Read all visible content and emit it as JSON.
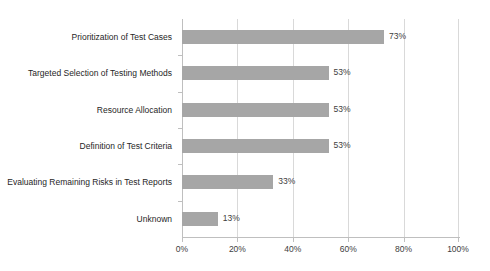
{
  "chart_data": {
    "type": "bar",
    "orientation": "horizontal",
    "title": "",
    "subtitle": "",
    "xlabel": "",
    "ylabel": "",
    "xlim": [
      0,
      100
    ],
    "grid": true,
    "legend": false,
    "legend_position": "none",
    "value_suffix": "%",
    "bar_color": "#A6A6A6",
    "gridline_color": "#D9D9D9",
    "axis_color": "#BFBFBF",
    "label_color": "#262626",
    "value_label_color": "#404040",
    "background_color": "#FFFFFF",
    "categories": [
      "Prioritization of Test Cases",
      "Targeted Selection of Testing Methods",
      "Resource Allocation",
      "Definition of Test Criteria",
      "Evaluating Remaining Risks in Test Reports",
      "Unknown"
    ],
    "values": [
      73,
      53,
      53,
      53,
      33,
      13
    ],
    "value_labels": [
      "73%",
      "53%",
      "53%",
      "53%",
      "33%",
      "13%"
    ],
    "xticks": [
      0,
      20,
      40,
      60,
      80,
      100
    ],
    "xticklabels": [
      "0%",
      "20%",
      "40%",
      "60%",
      "80%",
      "100%"
    ]
  }
}
